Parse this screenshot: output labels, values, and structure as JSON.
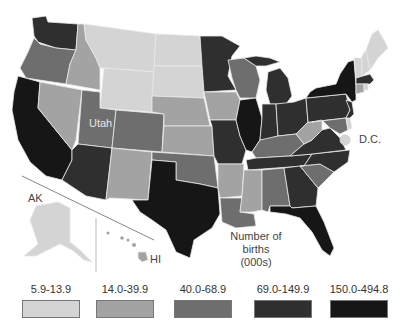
{
  "map": {
    "title_line1": "Number of",
    "title_line2": "births (000s)",
    "labels": {
      "utah": "Utah",
      "dc": "D.C.",
      "alaska": "AK",
      "hawaii": "HI"
    },
    "palette": {
      "c1": "#d4d4d4",
      "c2": "#a3a3a3",
      "c3": "#6e6e6e",
      "c4": "#2f2f2f",
      "c5": "#161616"
    },
    "states": {
      "WA": "c4",
      "OR": "c3",
      "CA": "c5",
      "ID": "c2",
      "NV": "c2",
      "MT": "c1",
      "WY": "c1",
      "UT": "c3",
      "AZ": "c4",
      "CO": "c3",
      "NM": "c2",
      "ND": "c1",
      "SD": "c1",
      "NE": "c2",
      "KS": "c2",
      "OK": "c3",
      "TX": "c5",
      "MN": "c4",
      "IA": "c2",
      "MO": "c4",
      "AR": "c2",
      "LA": "c3",
      "WI": "c3",
      "IL": "c5",
      "MI": "c4",
      "IN": "c4",
      "OH": "c4",
      "KY": "c3",
      "TN": "c4",
      "MS": "c2",
      "AL": "c3",
      "GA": "c4",
      "FL": "c5",
      "SC": "c3",
      "NC": "c4",
      "VA": "c4",
      "WV": "c2",
      "PA": "c4",
      "NY": "c5",
      "ME": "c1",
      "VT": "c1",
      "NH": "c1",
      "MA": "c4",
      "CT": "c2",
      "RI": "c1",
      "NJ": "c4",
      "DE": "c1",
      "MD": "c3",
      "DC": "c1",
      "AK": "c1",
      "HI": "c2"
    }
  },
  "legend": {
    "items": [
      {
        "label": "5.9-13.9",
        "color": "#d4d4d4"
      },
      {
        "label": "14.0-39.9",
        "color": "#a3a3a3"
      },
      {
        "label": "40.0-68.9",
        "color": "#6e6e6e"
      },
      {
        "label": "69.0-149.9",
        "color": "#2f2f2f"
      },
      {
        "label": "150.0-494.8",
        "color": "#161616"
      }
    ]
  }
}
